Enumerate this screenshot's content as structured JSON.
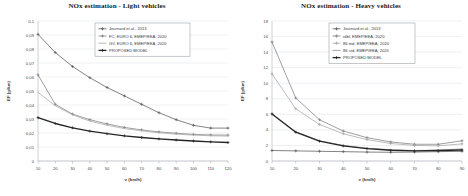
{
  "figure": {
    "panels": [
      "light",
      "heavy"
    ]
  },
  "light": {
    "title": "NOx estimation - Light vehicles",
    "xlabel": "v (km/h)",
    "ylabel": "EF (g/km)",
    "ytick_labels": [
      "0,1",
      "0,09",
      "0,08",
      "0,07",
      "0,06",
      "0,05",
      "0,04",
      "0,03",
      "0,02",
      "0,01",
      "0"
    ],
    "xtick_labels": [
      "10",
      "20",
      "30",
      "40",
      "50",
      "60",
      "70",
      "80",
      "90",
      "100",
      "110",
      "120"
    ],
    "legend": [
      "Journard et al., 2013",
      "FC, EURO 6, EMEP/EEA, 2020",
      "GV, EURO 6, EMEP/EEA, 2020",
      "PROPOSED MODEL"
    ]
  },
  "heavy": {
    "title": "NOx estimation - Heavy vehicles",
    "xlabel": "v (km/h)",
    "ylabel": "EF (g/km)",
    "ytick_labels": [
      "18",
      "16",
      "14",
      "12",
      "10",
      "8",
      "6",
      "4",
      "2",
      "0"
    ],
    "xtick_labels": [
      "10",
      "20",
      "30",
      "40",
      "50",
      "60",
      "70",
      "80",
      "90"
    ],
    "legend": [
      "Journard et al., 2013",
      "rdbl, EMEP/EEA, 2020",
      "86 md, EMEP/EEA, 2020",
      "86 std, EMEP/EEA, 2020",
      "PROPOSED MODEL"
    ]
  },
  "colors": {
    "series1": "#595959",
    "series2": "#7f7f7f",
    "series3": "#a6a6a6",
    "series4": "#262626",
    "series5": "#404040",
    "grid": "#d4d9e2",
    "axis": "#9aa0a8",
    "text": "#3a3a3a"
  },
  "chart_data": [
    {
      "type": "line",
      "title": "NOx estimation - Light vehicles",
      "xlabel": "v (km/h)",
      "ylabel": "EF (g/km)",
      "xlim": [
        10,
        120
      ],
      "ylim": [
        0,
        0.1
      ],
      "grid": true,
      "legend_position": "top-center",
      "x": [
        10,
        20,
        30,
        40,
        50,
        60,
        70,
        80,
        90,
        100,
        110,
        120
      ],
      "series": [
        {
          "name": "Journard et al., 2013",
          "marker": "plus",
          "color": "#595959",
          "values": [
            0.0905,
            0.0775,
            0.0675,
            0.0595,
            0.0525,
            0.0465,
            0.0405,
            0.0345,
            0.0295,
            0.0255,
            0.0235,
            0.0235
          ]
        },
        {
          "name": "FC, EURO 6, EMEP/EEA, 2020",
          "marker": "plus",
          "color": "#7f7f7f",
          "values": [
            0.0615,
            0.0405,
            0.0335,
            0.0295,
            0.0265,
            0.024,
            0.0222,
            0.0208,
            0.0198,
            0.019,
            0.0186,
            0.0185
          ]
        },
        {
          "name": "GV, EURO 6, EMEP/EEA, 2020",
          "marker": "none",
          "color": "#a6a6a6",
          "values": [
            0.049,
            0.0395,
            0.033,
            0.0285,
            0.0255,
            0.0232,
            0.0215,
            0.0202,
            0.0192,
            0.0185,
            0.018,
            0.0178
          ]
        },
        {
          "name": "PROPOSED MODEL",
          "marker": "plus",
          "color": "#262626",
          "values": [
            0.031,
            0.0268,
            0.0237,
            0.0213,
            0.0195,
            0.018,
            0.0168,
            0.0158,
            0.015,
            0.0143,
            0.0137,
            0.0132
          ]
        }
      ]
    },
    {
      "type": "line",
      "title": "NOx estimation - Heavy vehicles",
      "xlabel": "v (km/h)",
      "ylabel": "EF (g/km)",
      "xlim": [
        10,
        90
      ],
      "ylim": [
        0,
        18
      ],
      "grid": true,
      "legend_position": "top-center",
      "x": [
        10,
        20,
        30,
        40,
        50,
        60,
        70,
        80,
        90
      ],
      "series": [
        {
          "name": "Journard et al., 2013",
          "marker": "plus",
          "color": "#595959",
          "values": [
            1.35,
            1.3,
            1.25,
            1.2,
            1.15,
            1.12,
            1.15,
            1.2,
            1.25
          ]
        },
        {
          "name": "rdbl, EMEP/EEA, 2020",
          "marker": "plus",
          "color": "#7f7f7f",
          "values": [
            15.3,
            8.1,
            5.3,
            3.85,
            3.0,
            2.45,
            2.15,
            2.15,
            2.6
          ]
        },
        {
          "name": "86 md, EMEP/EEA, 2020",
          "marker": "plus",
          "color": "#a6a6a6",
          "values": [
            11.2,
            6.7,
            4.7,
            3.5,
            2.75,
            2.25,
            2.0,
            1.95,
            2.2
          ]
        },
        {
          "name": "86 std, EMEP/EEA, 2020",
          "marker": "none",
          "color": "#8c8c8c",
          "values": [
            6.05,
            3.75,
            2.6,
            2.0,
            1.65,
            1.45,
            1.35,
            1.4,
            1.55
          ]
        },
        {
          "name": "PROPOSED MODEL",
          "marker": "plus",
          "color": "#262626",
          "values": [
            6.05,
            3.7,
            2.55,
            1.95,
            1.6,
            1.38,
            1.3,
            1.35,
            1.42
          ]
        }
      ]
    }
  ]
}
